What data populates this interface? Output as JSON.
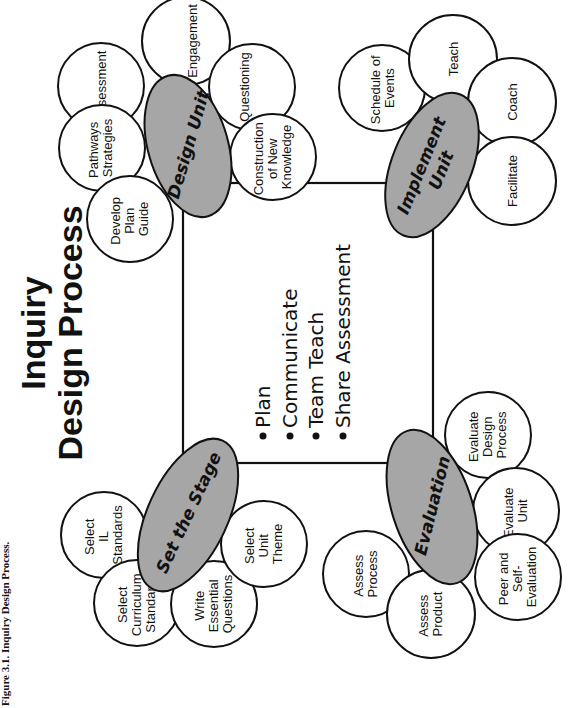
{
  "caption": "Figure 3.1. Inquiry Design Process.",
  "title": {
    "line1": "Inquiry",
    "line2": "Design Process"
  },
  "center_list": {
    "bullet": "•",
    "items": [
      "Plan",
      "Communicate",
      "Team Teach",
      "Share Assessment"
    ]
  },
  "colors": {
    "hub_fill": "#a6a6a6",
    "stroke": "#111111",
    "background": "#ffffff"
  },
  "stages": {
    "design_unit": {
      "label": "Design Unit",
      "nodes": [
        {
          "lines": [
            "Assessment"
          ]
        },
        {
          "lines": [
            "Engagement"
          ]
        },
        {
          "lines": [
            "Pathways",
            "Strategies"
          ]
        },
        {
          "lines": [
            "Develop",
            "Plan",
            "Guide"
          ]
        },
        {
          "lines": [
            "Questioning"
          ]
        },
        {
          "lines": [
            "Construction",
            "of New",
            "Knowledge"
          ]
        }
      ]
    },
    "implement_unit": {
      "label_line1": "Implement",
      "label_line2": "Unit",
      "nodes": [
        {
          "lines": [
            "Schedule of",
            "Events"
          ]
        },
        {
          "lines": [
            "Teach"
          ]
        },
        {
          "lines": [
            "Coach"
          ]
        },
        {
          "lines": [
            "Facilitate"
          ]
        }
      ]
    },
    "set_the_stage": {
      "label": "Set the Stage",
      "nodes": [
        {
          "lines": [
            "Select",
            "IL",
            "Standards"
          ]
        },
        {
          "lines": [
            "Select",
            "Curriculum",
            "Standards"
          ]
        },
        {
          "lines": [
            "Write",
            "Essential",
            "Questions"
          ]
        },
        {
          "lines": [
            "Select",
            "Unit",
            "Theme"
          ]
        }
      ]
    },
    "evaluation": {
      "label": "Evaluation",
      "nodes": [
        {
          "lines": [
            "Assess",
            "Process"
          ]
        },
        {
          "lines": [
            "Assess",
            "Product"
          ]
        },
        {
          "lines": [
            "Evaluate",
            "Design",
            "Process"
          ]
        },
        {
          "lines": [
            "Evaluate",
            "Unit"
          ]
        },
        {
          "lines": [
            "Peer and",
            "Self-",
            "Evaluation"
          ]
        }
      ]
    }
  }
}
